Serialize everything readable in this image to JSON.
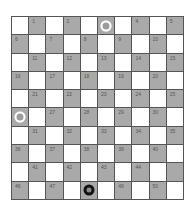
{
  "board": {
    "size": 10,
    "colors": {
      "light": "#ffffff",
      "dark": "#a9a9a9",
      "grid": "#555555"
    },
    "hidden_labels": [
      3,
      26,
      45,
      48
    ],
    "pieces": [
      {
        "square": 3,
        "color": "white",
        "type": "man"
      },
      {
        "square": 26,
        "color": "white",
        "type": "man"
      },
      {
        "square": 48,
        "color": "black",
        "type": "man"
      }
    ]
  }
}
